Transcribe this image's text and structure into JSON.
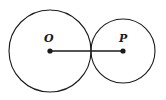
{
  "diagram": {
    "circles": [
      {
        "name": "circle-O",
        "center": "O",
        "cx": 50,
        "cy": 51,
        "r": 41
      },
      {
        "name": "circle-P",
        "center": "P",
        "cx": 123,
        "cy": 51,
        "r": 32
      }
    ],
    "points": [
      {
        "label": "O",
        "x": 50,
        "y": 51
      },
      {
        "label": "P",
        "x": 123,
        "y": 51
      }
    ],
    "segment": {
      "from": "O",
      "to": "P"
    },
    "labels": {
      "O": "O",
      "P": "P"
    }
  }
}
